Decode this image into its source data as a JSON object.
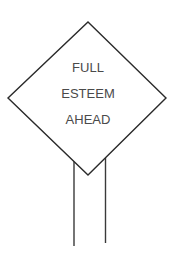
{
  "sign": {
    "lines": [
      "FULL",
      "ESTEEM",
      "AHEAD"
    ],
    "shape": "diamond",
    "stroke_color": "#2a2a2a",
    "text_color": "#4a4a4a",
    "background": "#ffffff"
  }
}
